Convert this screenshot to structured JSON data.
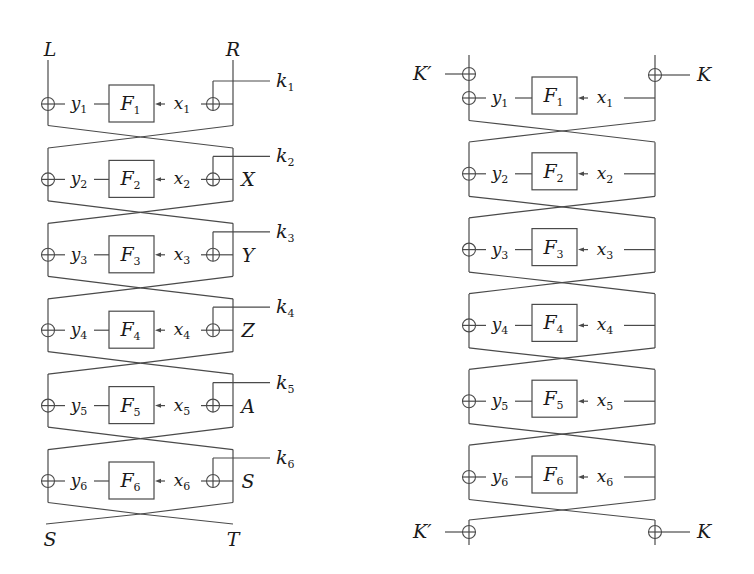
{
  "figure": {
    "left_network": {
      "inputs": {
        "left": "L",
        "right": "R"
      },
      "outputs": {
        "left": "S",
        "right": "T"
      },
      "rounds": [
        {
          "f": "F",
          "index": "1",
          "y": "y",
          "x": "x",
          "key": "k",
          "side_label": ""
        },
        {
          "f": "F",
          "index": "2",
          "y": "y",
          "x": "x",
          "key": "k",
          "side_label": "X"
        },
        {
          "f": "F",
          "index": "3",
          "y": "y",
          "x": "x",
          "key": "k",
          "side_label": "Y"
        },
        {
          "f": "F",
          "index": "4",
          "y": "y",
          "x": "x",
          "key": "k",
          "side_label": "Z"
        },
        {
          "f": "F",
          "index": "5",
          "y": "y",
          "x": "x",
          "key": "k",
          "side_label": "A"
        },
        {
          "f": "F",
          "index": "6",
          "y": "y",
          "x": "x",
          "key": "k",
          "side_label": "S"
        }
      ]
    },
    "right_network": {
      "whitening": {
        "left_key": "K′",
        "right_key": "K"
      },
      "rounds": [
        {
          "f": "F",
          "index": "1",
          "y": "y",
          "x": "x"
        },
        {
          "f": "F",
          "index": "2",
          "y": "y",
          "x": "x"
        },
        {
          "f": "F",
          "index": "3",
          "y": "y",
          "x": "x"
        },
        {
          "f": "F",
          "index": "4",
          "y": "y",
          "x": "x"
        },
        {
          "f": "F",
          "index": "5",
          "y": "y",
          "x": "x"
        },
        {
          "f": "F",
          "index": "6",
          "y": "y",
          "x": "x"
        }
      ]
    },
    "colors": {
      "line": "#4a4a4a",
      "text": "#1a1a1a",
      "background": "#ffffff"
    }
  }
}
